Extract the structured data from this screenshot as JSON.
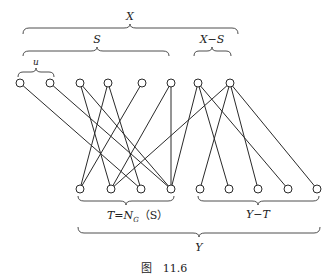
{
  "figure": {
    "caption": "图　11.6",
    "labels": {
      "X": "X",
      "S": "S",
      "X_minus_S": "X−S",
      "u": "u",
      "T": "T=N",
      "T_sub": "G",
      "T_tail": "（S）",
      "Y_minus_T": "Y−T",
      "Y": "Y"
    },
    "top_vertices": [
      "s1",
      "s2",
      "s3",
      "s4",
      "s5",
      "s6",
      "r1",
      "r2"
    ],
    "bottom_vertices": [
      "t1",
      "t2",
      "t3",
      "t4",
      "y1",
      "y2",
      "y3",
      "y4",
      "y5"
    ],
    "edges": [
      [
        "s1",
        "t3"
      ],
      [
        "s2",
        "t4"
      ],
      [
        "s3",
        "t2"
      ],
      [
        "s3",
        "t4"
      ],
      [
        "s4",
        "t1"
      ],
      [
        "s4",
        "t3"
      ],
      [
        "s5",
        "t1"
      ],
      [
        "s6",
        "t2"
      ],
      [
        "s6",
        "t4"
      ],
      [
        "r1",
        "t4"
      ],
      [
        "r1",
        "y2"
      ],
      [
        "r1",
        "y4"
      ],
      [
        "r2",
        "t2"
      ],
      [
        "r2",
        "y1"
      ],
      [
        "r2",
        "y3"
      ],
      [
        "r2",
        "y5"
      ]
    ]
  }
}
